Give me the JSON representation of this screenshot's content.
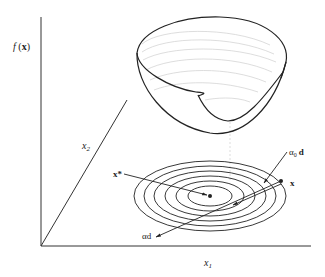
{
  "figure": {
    "y_axis_label": "f (x)",
    "x1_label": "x",
    "x1_sub": "1",
    "x2_label": "x",
    "x2_sub": "2",
    "x_star_label": "x*",
    "x_label": "x",
    "alpha0_d_label": "α",
    "alpha0_sub": "0",
    "alpha0_d_vec": "d",
    "alpha_d_label": "αd",
    "colors": {
      "line": "#222222",
      "faint": "#c8c8c8",
      "background": "#ffffff"
    }
  }
}
